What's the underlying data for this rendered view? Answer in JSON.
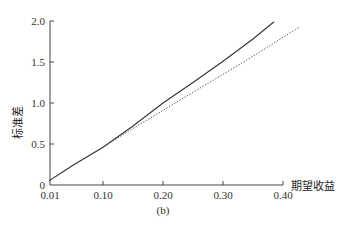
{
  "chart_data": {
    "type": "line",
    "title": "",
    "caption": "(b)",
    "xlabel": "期望收益",
    "ylabel": "标准差",
    "xlim": [
      0.01,
      0.4
    ],
    "ylim": [
      0,
      2.0
    ],
    "x_ticks": [
      0.01,
      0.1,
      0.2,
      0.3,
      0.4
    ],
    "x_tick_labels": [
      "0.01",
      "0.10",
      "0.20",
      "0.30",
      "0.40"
    ],
    "y_ticks": [
      0,
      0.5,
      1.0,
      1.5,
      2.0
    ],
    "y_tick_labels": [
      "0",
      "0.5",
      "1.0",
      "1.5",
      "2.0"
    ],
    "grid": false,
    "legend": null,
    "series": [
      {
        "name": "solid",
        "style": "solid",
        "color": "#333333",
        "x": [
          0.01,
          0.05,
          0.1,
          0.15,
          0.2,
          0.25,
          0.3,
          0.35,
          0.385
        ],
        "y": [
          0.05,
          0.24,
          0.46,
          0.72,
          1.0,
          1.25,
          1.51,
          1.78,
          1.99
        ]
      },
      {
        "name": "dashed",
        "style": "dashed",
        "color": "#555555",
        "x": [
          0.01,
          0.05,
          0.1,
          0.15,
          0.2,
          0.25,
          0.3,
          0.35,
          0.4,
          0.428
        ],
        "y": [
          0.05,
          0.24,
          0.46,
          0.69,
          0.91,
          1.13,
          1.35,
          1.57,
          1.8,
          1.93
        ]
      }
    ]
  }
}
